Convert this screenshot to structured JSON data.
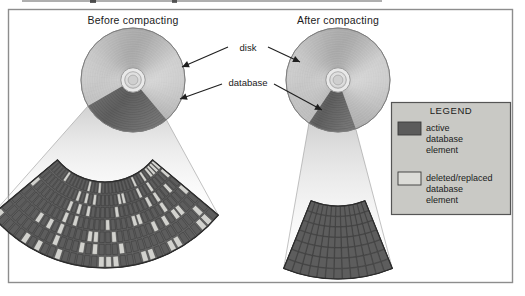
{
  "figure": {
    "titles": {
      "before": "Before compacting",
      "after": "After compacting"
    },
    "annotations": {
      "disk": "disk",
      "database": "database"
    },
    "legend": {
      "heading": "LEGEND",
      "items": [
        {
          "swatch": "active-swatch",
          "lines": [
            "active",
            "database",
            "element"
          ],
          "color": "#5b5b5b"
        },
        {
          "swatch": "deleted-swatch",
          "lines": [
            "deleted/replaced",
            "database",
            "element"
          ],
          "color": "#d6d6d2"
        }
      ],
      "panel_color": "#c9c9c5",
      "border_color": "#555555"
    },
    "colors": {
      "frame_border": "#8d8d8d",
      "page_background": "#ffffff",
      "disk_light": "#c2c2c2",
      "disk_mid": "#a8a8a8",
      "disk_dark": "#8f8f8f",
      "database_wedge": "#6a6a6a",
      "hub_ring": "#e6e6e6",
      "cell_active": "#5d5d5d",
      "cell_deleted": "#d2d2ce",
      "cell_grid": "#3f3f3f",
      "leader_line": "#8a8a8a"
    },
    "geometry": {
      "frame": {
        "x": 8,
        "y": 9,
        "width": 505,
        "height": 274
      },
      "disk_before": {
        "cx": 133,
        "cy": 80,
        "r": 52
      },
      "disk_after": {
        "cx": 338,
        "cy": 80,
        "r": 52
      },
      "wedge_before_deg": [
        50,
        150
      ],
      "wedge_after_deg": [
        70,
        124
      ],
      "fan_before": {
        "cx": 105,
        "cy": 120,
        "r_outer": 148,
        "r_inner": 62,
        "start_deg": 40,
        "end_deg": 140
      },
      "fan_after": {
        "cx": 338,
        "cy": 134,
        "r_outer": 145,
        "r_inner": 72,
        "start_deg": 68,
        "end_deg": 112
      }
    },
    "fan_before_grid": {
      "rings": 7,
      "columns": 34,
      "deleted_fraction": 0.3
    },
    "fan_after_grid": {
      "rings": 7,
      "columns": 13,
      "deleted_fraction": 0.0
    }
  }
}
